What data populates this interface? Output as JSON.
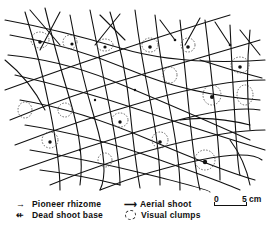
{
  "figure": {
    "line_color": "#111111",
    "clump_color": "#444444"
  },
  "legend": {
    "items": [
      {
        "symbol": "arrow-icon",
        "glyph": "→",
        "label": "Pioneer rhizome"
      },
      {
        "symbol": "dead-shoot-icon",
        "glyph": "⇷",
        "label": "Dead shoot base"
      },
      {
        "symbol": "aerial-arrow-icon",
        "glyph": "⟶",
        "label": "Aerial shoot"
      },
      {
        "symbol": "dashed-circle-icon",
        "glyph": "",
        "label": "Visual clumps"
      }
    ]
  },
  "scale_bar": {
    "start_label": "0",
    "end_label": "5 cm"
  }
}
